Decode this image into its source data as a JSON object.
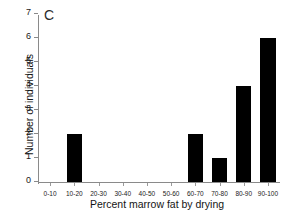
{
  "chart_data": {
    "type": "bar",
    "title": "",
    "panel_label": "C",
    "xlabel": "Percent marrow fat by drying",
    "ylabel": "Number of individuals",
    "categories": [
      "0-10",
      "10-20",
      "20-30",
      "30-40",
      "40-50",
      "50-60",
      "60-70",
      "70-80",
      "80-90",
      "90-100"
    ],
    "values": [
      0,
      2,
      0,
      0,
      0,
      0,
      2,
      1,
      4,
      6
    ],
    "ylim": [
      0,
      7
    ],
    "yticks": [
      0,
      1,
      2,
      3,
      4,
      5,
      6,
      7
    ],
    "ytick_labels": [
      "0",
      "1",
      "2",
      "3",
      "4",
      "5",
      "6",
      "7"
    ],
    "grid": false,
    "legend": "none",
    "bar_color": "#000000",
    "axis_color": "#8a8a8a"
  }
}
